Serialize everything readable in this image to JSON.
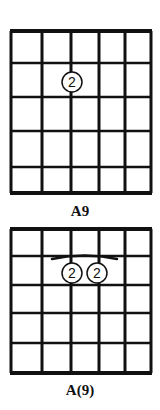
{
  "charts": [
    {
      "name": "A9",
      "label": "A9",
      "strings": 6,
      "frets_shown": 5,
      "grid": {
        "x": [
          11,
          42,
          71,
          99,
          125,
          151
        ],
        "y": [
          31,
          63,
          97,
          131,
          167,
          193
        ]
      },
      "fingers": [
        {
          "string_index": 2,
          "fret": 1,
          "finger": "2",
          "cx": 72,
          "cy": 82
        }
      ],
      "barre": null,
      "label_y": 203
    },
    {
      "name": "A(9)",
      "label": "A(9)",
      "strings": 6,
      "frets_shown": 5,
      "grid": {
        "x": [
          11,
          42,
          71,
          99,
          125,
          151
        ],
        "y": [
          229,
          256,
          285,
          313,
          343,
          373
        ]
      },
      "fingers": [
        {
          "string_index": 2,
          "fret": 1,
          "finger": "2",
          "cx": 72,
          "cy": 273
        },
        {
          "string_index": 3,
          "fret": 1,
          "finger": "2",
          "cx": 97,
          "cy": 273
        }
      ],
      "barre": {
        "from_x": 52,
        "to_x": 117,
        "y": 257
      },
      "label_y": 382
    }
  ],
  "colors": {
    "ink": "#111111",
    "paper": "#ffffff"
  }
}
